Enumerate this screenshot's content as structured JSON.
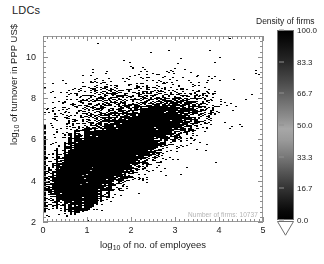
{
  "title": "LDCs",
  "annotation": "Number of firms: 10737",
  "colorbar": {
    "title": "Density of firms",
    "ticks": [
      100.0,
      83.3,
      66.7,
      50.0,
      33.3,
      16.7,
      0.0
    ],
    "tick_labels": [
      "100.0",
      "83.3",
      "66.7",
      "50.0",
      "33.3",
      "16.7",
      "0.0"
    ],
    "vmin": 0.0,
    "vmax": 100.0,
    "orientation": "vertical",
    "extend": "min"
  },
  "chart_data": {
    "type": "heatmap",
    "title": "LDCs",
    "xlabel_text": "log",
    "xlabel_sub": "10",
    "xlabel_rest": " of no. of employees",
    "ylabel_text": "log",
    "ylabel_sub": "10",
    "ylabel_rest": " of turnover in PPP US$",
    "xlabel": "log10 of no. of employees",
    "ylabel": "log10 of turnover in PPP US$",
    "xlim": [
      0,
      5
    ],
    "ylim": [
      2,
      11
    ],
    "xticks": [
      0,
      1,
      2,
      3,
      4,
      5
    ],
    "xticklabels": [
      "0",
      "1",
      "2",
      "3",
      "4",
      "5"
    ],
    "yticks": [
      2,
      4,
      6,
      8,
      10
    ],
    "yticklabels": [
      "2",
      "4",
      "6",
      "8",
      "10"
    ],
    "xminor_step": 0.1,
    "yminor_step": 0.25,
    "grid": false,
    "legend_position": "right",
    "colormap": "gray_reversed_peak",
    "cell_size_x": 0.0455,
    "cell_size_y": 0.0484,
    "n_points": 10737,
    "regression_slope": 1.05,
    "regression_intercept": 3.55,
    "clusters": [
      {
        "name": "main-cloud",
        "cx": 1.35,
        "cy": 5.05,
        "sx": 0.52,
        "sy": 0.8,
        "rho": 0.62,
        "weight": 0.46,
        "density": [
          25,
          95
        ]
      },
      {
        "name": "core-dense",
        "cx": 0.92,
        "cy": 4.4,
        "sx": 0.26,
        "sy": 0.55,
        "rho": 0.45,
        "weight": 0.3,
        "density": [
          55,
          100
        ]
      },
      {
        "name": "upper-tail",
        "cx": 2.05,
        "cy": 6.35,
        "sx": 0.55,
        "sy": 0.7,
        "rho": 0.55,
        "weight": 0.14,
        "density": [
          12,
          55
        ]
      },
      {
        "name": "right-tail",
        "cx": 2.85,
        "cy": 7.05,
        "sx": 0.45,
        "sy": 0.6,
        "rho": 0.4,
        "weight": 0.06,
        "density": [
          6,
          30
        ]
      },
      {
        "name": "sparse-top",
        "cx": 1.6,
        "cy": 7.6,
        "sx": 0.7,
        "sy": 0.75,
        "rho": 0.3,
        "weight": 0.04,
        "density": [
          4,
          20
        ]
      }
    ],
    "spike_columns": [
      {
        "x": 0.0,
        "y_low": 2.55,
        "y_high": 6.75,
        "density": 88
      },
      {
        "x": 0.3,
        "y_low": 2.7,
        "y_high": 5.6,
        "density": 48
      },
      {
        "x": 0.48,
        "y_low": 2.55,
        "y_high": 5.95,
        "density": 62
      },
      {
        "x": 0.6,
        "y_low": 2.45,
        "y_high": 6.35,
        "density": 74
      },
      {
        "x": 0.7,
        "y_low": 2.4,
        "y_high": 6.5,
        "density": 96
      },
      {
        "x": 0.78,
        "y_low": 2.5,
        "y_high": 6.3,
        "density": 82
      },
      {
        "x": 0.85,
        "y_low": 2.55,
        "y_high": 6.1,
        "density": 70
      },
      {
        "x": 0.95,
        "y_low": 2.6,
        "y_high": 6.55,
        "density": 90
      },
      {
        "x": 1.0,
        "y_low": 2.6,
        "y_high": 6.7,
        "density": 100
      },
      {
        "x": 1.08,
        "y_low": 2.75,
        "y_high": 6.2,
        "density": 66
      },
      {
        "x": 1.18,
        "y_low": 2.9,
        "y_high": 6.05,
        "density": 52
      },
      {
        "x": 1.3,
        "y_low": 3.05,
        "y_high": 6.4,
        "density": 58
      },
      {
        "x": 1.48,
        "y_low": 3.2,
        "y_high": 6.3,
        "density": 44
      }
    ],
    "bright_cells": [
      {
        "x": 0.95,
        "y": 4.15,
        "v": 100
      },
      {
        "x": 1.0,
        "y": 4.35,
        "v": 96
      },
      {
        "x": 0.98,
        "y": 3.95,
        "v": 92
      },
      {
        "x": 1.05,
        "y": 4.55,
        "v": 88
      },
      {
        "x": 0.9,
        "y": 4.3,
        "v": 84
      },
      {
        "x": 1.12,
        "y": 4.7,
        "v": 78
      },
      {
        "x": 0.86,
        "y": 3.85,
        "v": 74
      },
      {
        "x": 1.18,
        "y": 4.95,
        "v": 68
      }
    ]
  },
  "axes": {
    "frame_color": "#9a9a9a",
    "tick_color": "#8d8d8d",
    "text_color": "#1c1c1c"
  }
}
